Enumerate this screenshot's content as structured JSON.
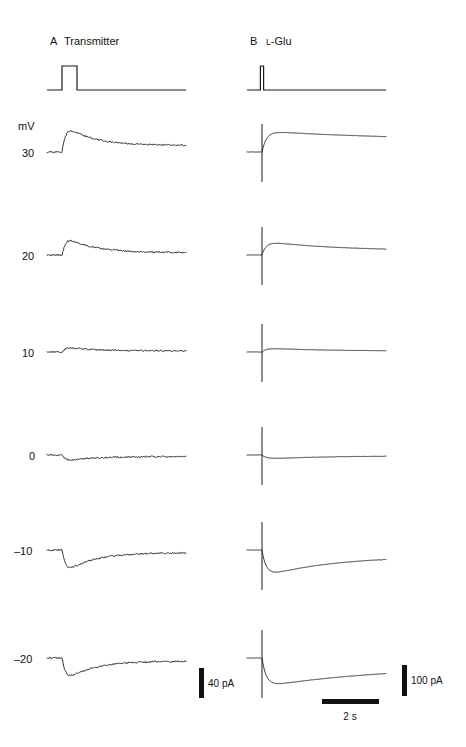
{
  "figure": {
    "title_a_letter": "A",
    "title_a_name": "Transmitter",
    "title_b_letter": "B",
    "title_b_name_prefix": "L",
    "title_b_name_rest": "-Glu",
    "voltage_unit": "mV",
    "trace_color": "#1a1a1a",
    "background": "#ffffff"
  },
  "voltage_labels": [
    "30",
    "20",
    "10",
    "0",
    "–10",
    "–20"
  ],
  "scalebars": {
    "left_current": "40 pA",
    "right_current": "100 pA",
    "time": "2 s"
  },
  "chart_data": {
    "type": "line",
    "xlabel": "Time (s)",
    "ylabel": "Current (pA)",
    "legend": [
      "A Transmitter",
      "B L-Glu"
    ],
    "grid": false,
    "panels": [
      {
        "name": "A",
        "stimulus_label": "Transmitter",
        "stimulus_type": "square-pulse",
        "stimulus_onset_s": 0.55,
        "stimulus_duration_s": 0.55,
        "x_range_s": [
          0,
          4.6
        ],
        "current_scale_bar_pa": 40,
        "series": [
          {
            "holding_mV": 30,
            "peak_pa": 34,
            "plateau_pa": 9,
            "polarity": "outward",
            "noisy": true
          },
          {
            "holding_mV": 20,
            "peak_pa": 21,
            "plateau_pa": 3,
            "polarity": "outward",
            "noisy": true
          },
          {
            "holding_mV": 10,
            "peak_pa": 5,
            "plateau_pa": 1,
            "polarity": "outward",
            "noisy": true
          },
          {
            "holding_mV": 0,
            "peak_pa": -4,
            "plateau_pa": -1,
            "polarity": "inward",
            "noisy": true
          },
          {
            "holding_mV": -10,
            "peak_pa": -22,
            "plateau_pa": -3,
            "polarity": "inward",
            "noisy": true
          },
          {
            "holding_mV": -20,
            "peak_pa": -33,
            "plateau_pa": -5,
            "polarity": "inward",
            "noisy": true
          }
        ]
      },
      {
        "name": "B",
        "stimulus_label": "L-Glu",
        "stimulus_type": "brief-spike",
        "stimulus_onset_s": 0.55,
        "stimulus_duration_s": 0.05,
        "x_range_s": [
          0,
          4.6
        ],
        "current_scale_bar_pa": 100,
        "series": [
          {
            "holding_mV": 30,
            "peak_pa": 88,
            "plateau_pa": 46,
            "polarity": "outward",
            "noisy": false
          },
          {
            "holding_mV": 20,
            "peak_pa": 52,
            "plateau_pa": 16,
            "polarity": "outward",
            "noisy": false
          },
          {
            "holding_mV": 10,
            "peak_pa": 12,
            "plateau_pa": 2,
            "polarity": "outward",
            "noisy": false
          },
          {
            "holding_mV": 0,
            "peak_pa": -6,
            "plateau_pa": -1,
            "polarity": "inward",
            "noisy": false
          },
          {
            "holding_mV": -10,
            "peak_pa": -46,
            "plateau_pa": -10,
            "polarity": "inward",
            "noisy": false
          },
          {
            "holding_mV": -20,
            "peak_pa": -92,
            "plateau_pa": -26,
            "polarity": "inward",
            "noisy": false
          }
        ]
      }
    ],
    "geometry": {
      "panelA_x0": 47,
      "panelA_x1": 186,
      "panelB_x0": 247,
      "panelB_x1": 386,
      "stim_baseline_y": 90,
      "stim_top_y": 66,
      "stim_onset_x_a": 62,
      "stim_offset_x_a": 77,
      "stim_x_b": 262,
      "row_baselines_y": [
        152,
        255,
        352,
        455,
        550,
        658
      ],
      "peaks_a_y": [
        127,
        238,
        347,
        461,
        571,
        679
      ],
      "peaks_b_y": [
        131,
        241,
        348,
        459,
        577,
        687
      ]
    }
  }
}
